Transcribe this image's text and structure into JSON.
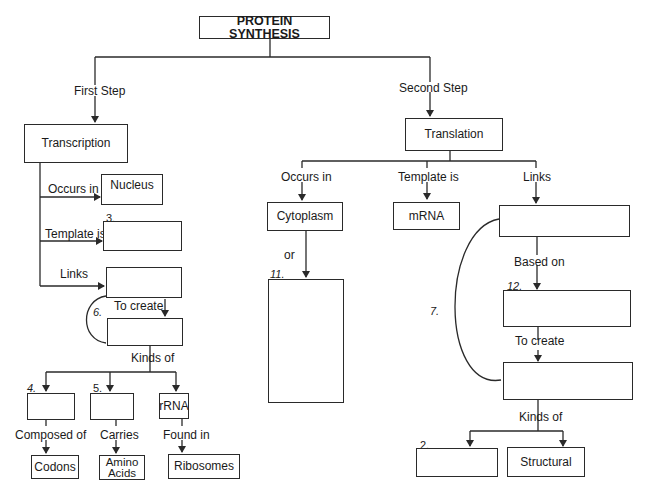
{
  "diagram": {
    "title": "PROTEIN SYNTHESIS",
    "left": {
      "step_label": "First Step",
      "process": "Transcription",
      "occurs_in_label": "Occurs in",
      "occurs_in_value": "Nucleus",
      "template_label": "Template is",
      "template_number": "3.",
      "template_value": "",
      "links_label": "Links",
      "links_value": "",
      "cycle_number": "6.",
      "to_create_label": "To create",
      "to_create_value": "",
      "kinds_label": "Kinds of",
      "kinds": [
        {
          "number": "4.",
          "value": "",
          "relation": "Composed of",
          "target": "Codons"
        },
        {
          "number": "5.",
          "value": "",
          "relation": "Carries",
          "target": "Amino Acids"
        },
        {
          "number": "",
          "value": "rRNA",
          "relation": "Found in",
          "target": "Ribosomes"
        }
      ]
    },
    "right": {
      "step_label": "Second Step",
      "process": "Translation",
      "occurs_in_label": "Occurs in",
      "occurs_in_value": "Cytoplasm",
      "or_label": "or",
      "or_number": "11.",
      "or_value": "",
      "template_label": "Template is",
      "template_value": "mRNA",
      "links_label": "Links",
      "links_value": "",
      "based_on_label": "Based on",
      "based_on_number": "12.",
      "based_on_value": "",
      "cycle_number": "7.",
      "to_create_label": "To create",
      "to_create_value": "",
      "kinds_label": "Kinds of",
      "kinds": [
        {
          "number": "2.",
          "value": ""
        },
        {
          "number": "",
          "value": "Structural"
        }
      ]
    }
  },
  "colors": {
    "line": "#2a2a2a",
    "background": "#ffffff"
  }
}
